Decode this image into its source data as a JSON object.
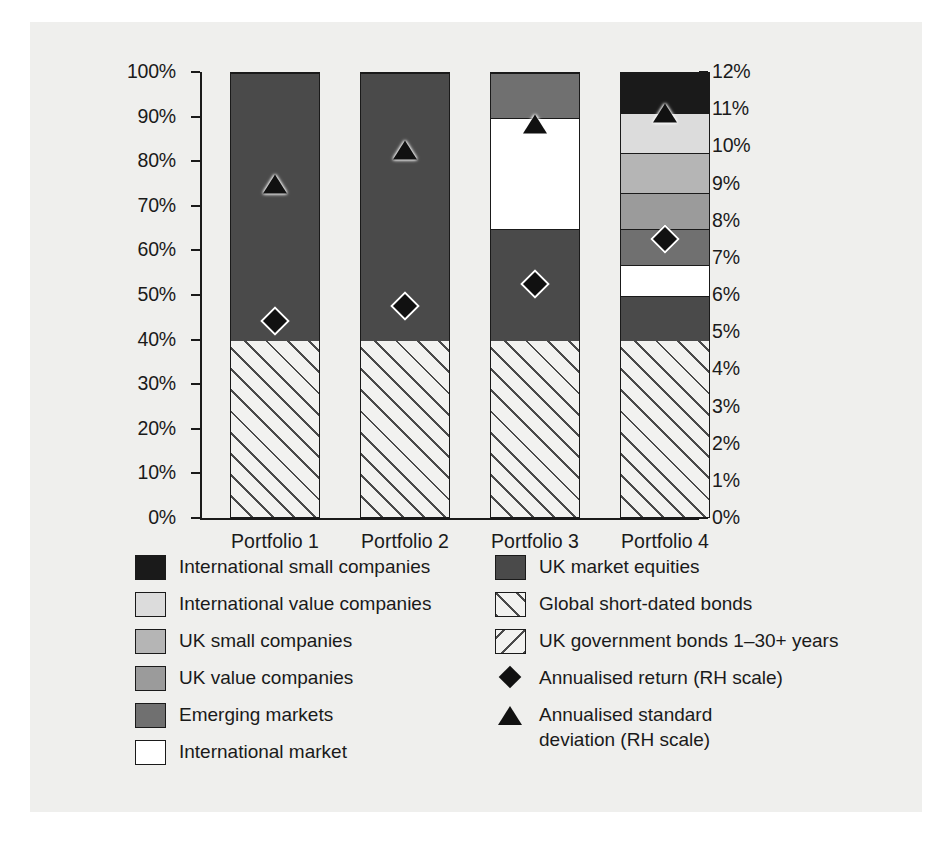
{
  "chart_data": {
    "type": "bar",
    "title": "",
    "subtitle": "",
    "xlabel": "",
    "ylabel": "",
    "categories": [
      "Portfolio 1",
      "Portfolio 2",
      "Portfolio 3",
      "Portfolio 4"
    ],
    "left_axis": {
      "label": "",
      "ylim": [
        0,
        100
      ],
      "unit": "%",
      "ticks": [
        0,
        10,
        20,
        30,
        40,
        50,
        60,
        70,
        80,
        90,
        100
      ],
      "tick_labels": [
        "0%",
        "10%",
        "20%",
        "30%",
        "40%",
        "50%",
        "60%",
        "70%",
        "80%",
        "90%",
        "100%"
      ]
    },
    "right_axis": {
      "label": "RH scale",
      "ylim": [
        0,
        12
      ],
      "unit": "%",
      "ticks": [
        0,
        1,
        2,
        3,
        4,
        5,
        6,
        7,
        8,
        9,
        10,
        11,
        12
      ],
      "tick_labels": [
        "0%",
        "1%",
        "2%",
        "3%",
        "4%",
        "5%",
        "6%",
        "7%",
        "8%",
        "9%",
        "10%",
        "11%",
        "12%"
      ]
    },
    "grid": false,
    "legend_position": "below",
    "stacking": "percent",
    "series": [
      {
        "name": "Global short-dated bonds",
        "key": "global_bonds",
        "color": "#f2f2f0",
        "pattern": "forward-hatch",
        "values": [
          40,
          40,
          40,
          40
        ]
      },
      {
        "name": "UK market equities",
        "key": "uk_equities",
        "color": "#4a4a4a",
        "pattern": "solid",
        "values": [
          60,
          60,
          25,
          10
        ]
      },
      {
        "name": "International market",
        "key": "intl_market",
        "color": "#ffffff",
        "pattern": "solid",
        "values": [
          0,
          0,
          25,
          7
        ]
      },
      {
        "name": "Emerging markets",
        "key": "emerging",
        "color": "#707070",
        "pattern": "solid",
        "values": [
          0,
          0,
          10,
          8
        ]
      },
      {
        "name": "UK value companies",
        "key": "uk_value",
        "color": "#9b9b9b",
        "pattern": "solid",
        "values": [
          0,
          0,
          0,
          8
        ]
      },
      {
        "name": "UK small companies",
        "key": "uk_small",
        "color": "#b5b5b5",
        "pattern": "solid",
        "values": [
          0,
          0,
          0,
          9
        ]
      },
      {
        "name": "International value companies",
        "key": "intl_value",
        "color": "#dcdcdc",
        "pattern": "solid",
        "values": [
          0,
          0,
          0,
          9
        ]
      },
      {
        "name": "International small companies",
        "key": "intl_small",
        "color": "#1a1a1a",
        "pattern": "solid",
        "values": [
          0,
          0,
          0,
          9
        ]
      }
    ],
    "markers": [
      {
        "name": "Annualised return (RH scale)",
        "symbol": "diamond",
        "axis": "right",
        "values": [
          5.3,
          5.7,
          6.3,
          7.5
        ]
      },
      {
        "name": "Annualised standard deviation (RH scale)",
        "symbol": "triangle",
        "axis": "right",
        "values": [
          9.0,
          9.9,
          10.6,
          10.9
        ]
      }
    ]
  },
  "axis": {
    "left_ticks": [
      "100%",
      "90%",
      "80%",
      "70%",
      "60%",
      "50%",
      "40%",
      "30%",
      "20%",
      "10%",
      "0%"
    ],
    "right_ticks": [
      "12%",
      "11%",
      "10%",
      "9%",
      "8%",
      "7%",
      "6%",
      "5%",
      "4%",
      "3%",
      "2%",
      "1%",
      "0%"
    ]
  },
  "categories": [
    "Portfolio 1",
    "Portfolio 2",
    "Portfolio 3",
    "Portfolio 4"
  ],
  "legend": {
    "left_column": [
      {
        "label": "International small companies",
        "swatch": "intl-small-swatch"
      },
      {
        "label": "International value companies",
        "swatch": "intl-value-swatch"
      },
      {
        "label": "UK small companies",
        "swatch": "uk-small-swatch"
      },
      {
        "label": "UK value companies",
        "swatch": "uk-value-swatch"
      },
      {
        "label": "Emerging markets",
        "swatch": "emerging-swatch"
      },
      {
        "label": "International market",
        "swatch": "intl-market-swatch"
      }
    ],
    "right_column": [
      {
        "label": "UK market equities",
        "swatch": "uk-equities-swatch"
      },
      {
        "label": "Global short-dated bonds",
        "swatch": "global-bonds-swatch"
      },
      {
        "label": "UK government bonds 1–30+ years",
        "swatch": "gilts-swatch"
      },
      {
        "label": "Annualised return (RH scale)",
        "swatch": "diamond-marker"
      },
      {
        "label": "Annualised standard\ndeviation (RH scale)",
        "swatch": "triangle-marker"
      }
    ]
  },
  "colors": {
    "intl_small": "#1a1a1a",
    "intl_value": "#dcdcdc",
    "uk_small": "#b5b5b5",
    "uk_value": "#9b9b9b",
    "emerging": "#707070",
    "intl_market": "#ffffff",
    "uk_equities": "#4a4a4a",
    "background": "#efefed",
    "axis": "#1a1a1a"
  }
}
